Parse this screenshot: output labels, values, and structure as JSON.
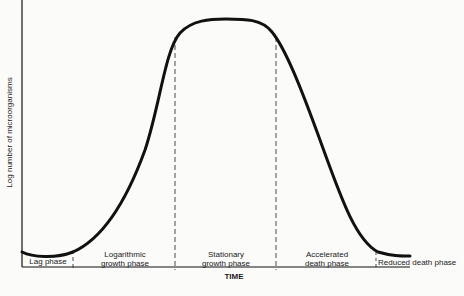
{
  "diagram": {
    "y_axis_label": "Log number of microorganisms",
    "x_axis_label": "TIME",
    "phases": [
      {
        "name": "lag",
        "label_line1": "Lag phase",
        "label_line2": ""
      },
      {
        "name": "logarithmic",
        "label_line1": "Logarithmic",
        "label_line2": "growth phase"
      },
      {
        "name": "stationary",
        "label_line1": "Stationary",
        "label_line2": "growth phase"
      },
      {
        "name": "accelerated-death",
        "label_line1": "Accelerated",
        "label_line2": "death phase"
      },
      {
        "name": "reduced-death",
        "label_line1": "Reduced death phase",
        "label_line2": ""
      }
    ],
    "colors": {
      "curve": "#111111",
      "axis": "#111111",
      "divider": "#222222",
      "background": "#fbfbfa"
    }
  }
}
